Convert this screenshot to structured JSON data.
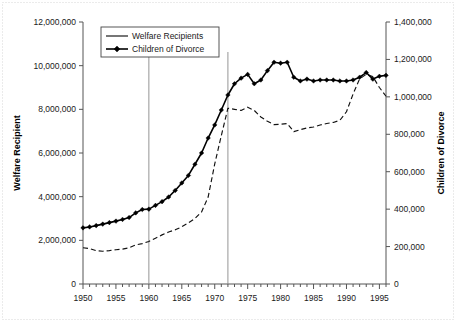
{
  "chart_data": {
    "type": "line",
    "title": "",
    "xlabel": "",
    "ylabel": "Welfare Recipient",
    "y2label": "Children of Divorce",
    "xlim": [
      1950,
      1996
    ],
    "ylim": [
      0,
      12000000
    ],
    "y2lim": [
      0,
      1400000
    ],
    "grid": false,
    "legend_position": "top-left-inside",
    "x_tick_labels": [
      "1950",
      "1955",
      "1960",
      "1965",
      "1970",
      "1975",
      "1980",
      "1985",
      "1990",
      "1995"
    ],
    "x_tick_values": [
      1950,
      1955,
      1960,
      1965,
      1970,
      1975,
      1980,
      1985,
      1990,
      1995
    ],
    "x_minor_tick_step": 1,
    "y_tick_labels": [
      "0",
      "2,000,000",
      "4,000,000",
      "6,000,000",
      "8,000,000",
      "10,000,000",
      "12,000,000"
    ],
    "y_tick_values": [
      0,
      2000000,
      4000000,
      6000000,
      8000000,
      10000000,
      12000000
    ],
    "y2_tick_labels": [
      "0",
      "200,000",
      "400,000",
      "600,000",
      "800,000",
      "1,000,000",
      "1,200,000",
      "1,400,000"
    ],
    "y2_tick_values": [
      0,
      200000,
      400000,
      600000,
      800000,
      1000000,
      1200000,
      1400000
    ],
    "x": [
      1950,
      1951,
      1952,
      1953,
      1954,
      1955,
      1956,
      1957,
      1958,
      1959,
      1960,
      1961,
      1962,
      1963,
      1964,
      1965,
      1966,
      1967,
      1968,
      1969,
      1970,
      1971,
      1972,
      1973,
      1974,
      1975,
      1976,
      1977,
      1978,
      1979,
      1980,
      1981,
      1982,
      1983,
      1984,
      1985,
      1986,
      1987,
      1988,
      1989,
      1990,
      1991,
      1992,
      1993,
      1994,
      1995,
      1996
    ],
    "series": [
      {
        "name": "Welfare Recipients",
        "axis": "left",
        "style": "dashed-line",
        "marker": "none",
        "color": "#111111",
        "values": [
          1660000,
          1620000,
          1530000,
          1500000,
          1530000,
          1570000,
          1600000,
          1660000,
          1790000,
          1850000,
          1950000,
          2100000,
          2250000,
          2380000,
          2480000,
          2620000,
          2800000,
          3000000,
          3300000,
          3980000,
          5500000,
          6800000,
          8050000,
          8000000,
          7950000,
          8100000,
          7950000,
          7650000,
          7450000,
          7300000,
          7320000,
          7350000,
          6980000,
          7070000,
          7150000,
          7190000,
          7280000,
          7350000,
          7400000,
          7500000,
          7890000,
          8700000,
          9400000,
          9600000,
          9500000,
          9000000,
          8600000
        ]
      },
      {
        "name": "Children of Divorce",
        "axis": "right",
        "style": "solid-line",
        "marker": "diamond",
        "color": "#000000",
        "values": [
          300000,
          305000,
          312000,
          320000,
          328000,
          336000,
          345000,
          355000,
          380000,
          398000,
          400000,
          420000,
          440000,
          465000,
          500000,
          540000,
          580000,
          640000,
          700000,
          780000,
          850000,
          930000,
          1010000,
          1070000,
          1100000,
          1120000,
          1070000,
          1090000,
          1140000,
          1185000,
          1180000,
          1185000,
          1105000,
          1085000,
          1095000,
          1085000,
          1090000,
          1090000,
          1090000,
          1085000,
          1085000,
          1090000,
          1105000,
          1130000,
          1095000,
          1110000,
          1115000
        ]
      }
    ],
    "annotations": [
      {
        "name": "span-1960-1972",
        "label": "1960-1972",
        "x_start": 1960,
        "x_end": 1972,
        "y_value": 1600000,
        "style": "double-arrow"
      }
    ],
    "reference_lines": [
      {
        "name": "ref-line-1960",
        "x": 1960
      },
      {
        "name": "ref-line-1972",
        "x": 1972
      }
    ],
    "legend_entries": [
      "Welfare Recipients",
      "Children of Divorce"
    ]
  }
}
